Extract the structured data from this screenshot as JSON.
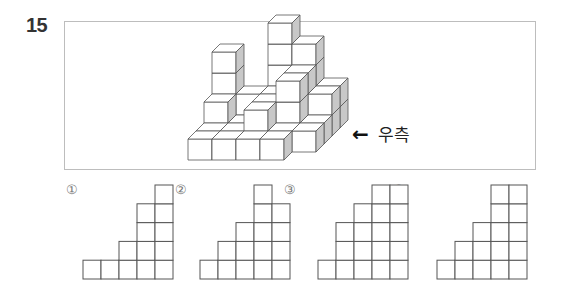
{
  "question": {
    "number": "15",
    "direction_label": "우측",
    "direction_arrow": "🡐"
  },
  "figure": {
    "origin": [
      188,
      160
    ],
    "face_w": 24,
    "face_h": 21,
    "depth_dx": 8,
    "depth_dy": -8,
    "colors": {
      "front": "#ffffff",
      "top": "#ffffff",
      "side": "#c8c8c8",
      "stroke": "#555555"
    },
    "cubes": [
      [
        0,
        0,
        0
      ],
      [
        1,
        0,
        0
      ],
      [
        2,
        0,
        0
      ],
      [
        3,
        0,
        0
      ],
      [
        0,
        1,
        0
      ],
      [
        1,
        1,
        0
      ],
      [
        2,
        1,
        0
      ],
      [
        3,
        1,
        0
      ],
      [
        4,
        1,
        0
      ],
      [
        0,
        2,
        0
      ],
      [
        1,
        2,
        0
      ],
      [
        2,
        2,
        0
      ],
      [
        3,
        2,
        0
      ],
      [
        4,
        2,
        0
      ],
      [
        0,
        3,
        0
      ],
      [
        1,
        3,
        0
      ],
      [
        2,
        3,
        0
      ],
      [
        3,
        3,
        0
      ],
      [
        4,
        3,
        0
      ],
      [
        1,
        4,
        0
      ],
      [
        2,
        4,
        0
      ],
      [
        3,
        4,
        0
      ],
      [
        4,
        4,
        0
      ],
      [
        0,
        2,
        1
      ],
      [
        0,
        3,
        1
      ],
      [
        0,
        3,
        2
      ],
      [
        0,
        3,
        3
      ],
      [
        1,
        3,
        1
      ],
      [
        2,
        1,
        1
      ],
      [
        2,
        2,
        1
      ],
      [
        2,
        3,
        1
      ],
      [
        3,
        2,
        1
      ],
      [
        3,
        2,
        2
      ],
      [
        2,
        4,
        1
      ],
      [
        2,
        4,
        2
      ],
      [
        2,
        4,
        3
      ],
      [
        2,
        4,
        4
      ],
      [
        3,
        4,
        1
      ],
      [
        3,
        4,
        2
      ],
      [
        3,
        4,
        3
      ],
      [
        4,
        3,
        1
      ],
      [
        4,
        4,
        1
      ],
      [
        3,
        3,
        1
      ],
      [
        3,
        3,
        2
      ]
    ]
  },
  "options": [
    {
      "label": "①",
      "x": 66,
      "grid_left": 83,
      "heights": [
        1,
        1,
        2,
        4,
        5
      ]
    },
    {
      "label": "②",
      "x": 175,
      "grid_left": 200,
      "heights": [
        1,
        2,
        3,
        5,
        4
      ]
    },
    {
      "label": "③",
      "x": 284,
      "grid_left": 318,
      "heights": [
        1,
        3,
        4,
        5,
        5
      ]
    },
    {
      "label": "④",
      "x": 393,
      "grid_left": 437,
      "heights": [
        1,
        2,
        3,
        5,
        5
      ]
    }
  ],
  "option_grid": {
    "bottom": 279,
    "cell_w": 18,
    "cell_h": 18.8,
    "stroke": "#555555"
  }
}
